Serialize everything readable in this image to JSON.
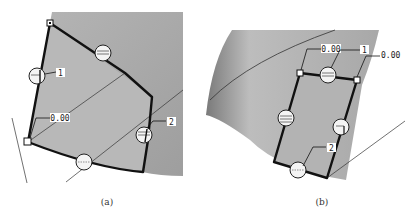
{
  "figure": {
    "panels": [
      {
        "id": "a",
        "caption": "(a)",
        "labels": {
          "value_tag": "0.00",
          "tag_1": "1",
          "tag_2": "2"
        }
      },
      {
        "id": "b",
        "caption": "(b)",
        "labels": {
          "value_tag_left": "0.00",
          "value_tag_right": "0.00",
          "tag_1": "1",
          "tag_2": "2"
        }
      }
    ],
    "colors": {
      "surface": "#a9a9a9",
      "surface_light": "#c8c8c8",
      "boundary": "#111111",
      "background": "#ffffff"
    }
  }
}
